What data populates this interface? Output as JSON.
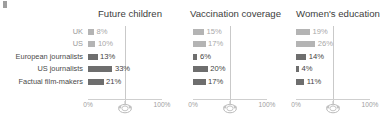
{
  "chart_data": {
    "type": "bar",
    "title": "",
    "orientation": "horizontal",
    "categories": [
      "UK",
      "US",
      "European journalists",
      "US journalists",
      "Factual film-makers"
    ],
    "category_styles": [
      "muted",
      "muted",
      "normal",
      "normal",
      "normal"
    ],
    "panels": [
      {
        "title": "Future children",
        "values": [
          8,
          10,
          13,
          33,
          21
        ],
        "value_labels": [
          "8%",
          "10%",
          "13%",
          "33%",
          "21%"
        ]
      },
      {
        "title": "Vaccination coverage",
        "values": [
          15,
          17,
          6,
          20,
          17
        ],
        "value_labels": [
          "15%",
          "17%",
          "6%",
          "20%",
          "17%"
        ]
      },
      {
        "title": "Women's education",
        "values": [
          19,
          26,
          14,
          4,
          11
        ],
        "value_labels": [
          "19%",
          "26%",
          "14%",
          "4%",
          "11%"
        ]
      }
    ],
    "xlabel": "",
    "ylabel": "",
    "xlim": [
      0,
      100
    ],
    "axis_ticks": [
      "0%",
      "100%"
    ],
    "grid": true,
    "gridline_value": 50,
    "legend": [],
    "marker_icon": "reference-marker-icon",
    "colors": {
      "bar": "#6e6e6e",
      "bar_muted": "#b4b4b4",
      "gridline": "#c9c9c9",
      "axis": "#cfcfcf",
      "text": "#3f3f3f",
      "text_muted": "#9e9e9e"
    }
  }
}
